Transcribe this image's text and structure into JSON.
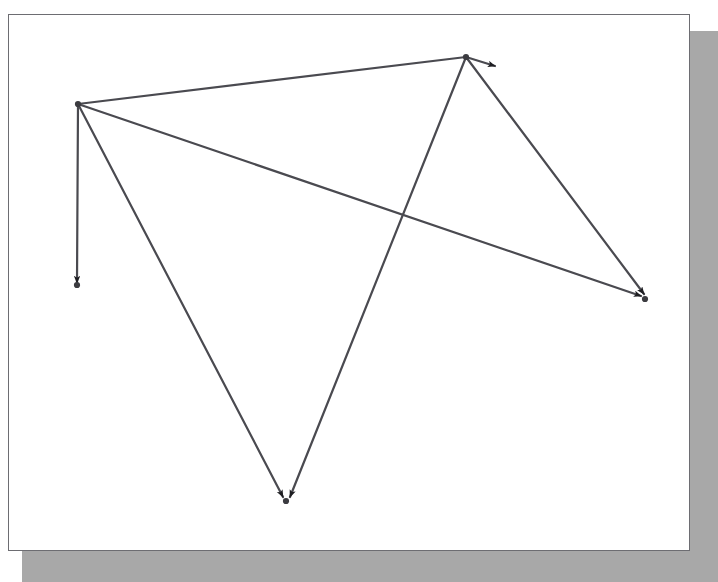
{
  "window": {
    "title": "",
    "page_background": "#ffffff",
    "shadow_color": "#a8a8a8",
    "border_color": "#6d6d72"
  },
  "graph": {
    "type": "directed-graph",
    "edge_color": "#4a4a50",
    "node_color": "#3b3b40",
    "arrow_color": "#1e1e22",
    "edge_width": 2.2,
    "nodes": [
      {
        "id": "n1",
        "label": "",
        "x": 78,
        "y": 104
      },
      {
        "id": "n2",
        "label": "",
        "x": 466,
        "y": 57
      },
      {
        "id": "n3",
        "label": "",
        "x": 77,
        "y": 285
      },
      {
        "id": "n4",
        "label": "",
        "x": 286,
        "y": 501
      },
      {
        "id": "n5",
        "label": "",
        "x": 645,
        "y": 299
      }
    ],
    "edges": [
      {
        "id": "e1",
        "from": "n1",
        "to": "n2",
        "arrow": false,
        "x1": 78,
        "y1": 104,
        "x2": 466,
        "y2": 57,
        "directed": false
      },
      {
        "id": "e2",
        "from": "n1",
        "to": "n3",
        "arrow": true,
        "x1": 78,
        "y1": 104,
        "x2": 77,
        "y2": 283,
        "directed": true
      },
      {
        "id": "e3",
        "from": "n1",
        "to": "n4",
        "arrow": true,
        "x1": 78,
        "y1": 104,
        "x2": 283,
        "y2": 497,
        "directed": true
      },
      {
        "id": "e4",
        "from": "n1",
        "to": "n5",
        "arrow": true,
        "x1": 78,
        "y1": 104,
        "x2": 641,
        "y2": 296,
        "directed": true
      },
      {
        "id": "e5",
        "from": "n2",
        "to": "n4",
        "arrow": true,
        "x1": 466,
        "y1": 57,
        "x2": 290,
        "y2": 497,
        "directed": true
      },
      {
        "id": "e6",
        "from": "n2",
        "to": "n5",
        "arrow": true,
        "x1": 466,
        "y1": 57,
        "x2": 644,
        "y2": 294,
        "directed": true
      },
      {
        "id": "e7",
        "from": "n2",
        "to": "stub",
        "arrow": true,
        "x1": 466,
        "y1": 57,
        "x2": 495,
        "y2": 66,
        "directed": true
      }
    ],
    "crossing_points": [
      {
        "x": 400,
        "y": 222,
        "edges": [
          "e4",
          "e5"
        ]
      }
    ],
    "annotations": []
  }
}
